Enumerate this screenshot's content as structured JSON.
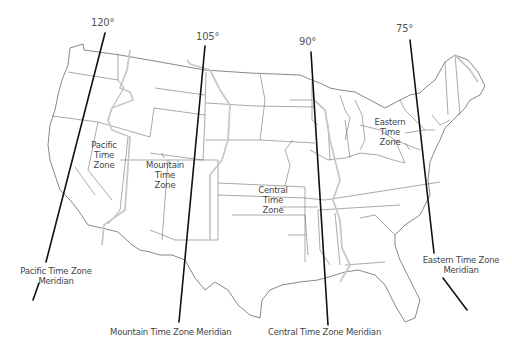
{
  "meridians": [
    {
      "degree": "120°",
      "label": "Pacific Time Zone Meridian",
      "label_line1": "Pacific Time Zone",
      "label_line2": "Meridian"
    },
    {
      "degree": "105°",
      "label": "Mountain Time Zone Meridian"
    },
    {
      "degree": "90°",
      "label": "Central Time Zone Meridian"
    },
    {
      "degree": "75°",
      "label": "Eastern Time Zone Meridian",
      "label_line1": "Eastern Time Zone",
      "label_line2": "Meridian"
    }
  ],
  "zones": [
    {
      "name": "Pacific Time Zone",
      "line1": "Pacific",
      "line2": "Time",
      "line3": "Zone"
    },
    {
      "name": "Mountain Time Zone",
      "line1": "Mountain",
      "line2": "Time",
      "line3": "Zone"
    },
    {
      "name": "Central Time Zone",
      "line1": "Central",
      "line2": "Time",
      "line3": "Zone"
    },
    {
      "name": "Eastern Time Zone",
      "line1": "Eastern",
      "line2": "Time",
      "line3": "Zone"
    }
  ],
  "colors": {
    "state_border": "#555555",
    "zone_boundary": "#c8c8c8",
    "meridian_line": "#111111",
    "background": "#ffffff"
  }
}
